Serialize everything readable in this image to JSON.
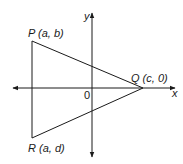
{
  "diagram": {
    "type": "coordinate-geometry",
    "axes": {
      "x_label": "x",
      "y_label": "y",
      "origin_label": "0"
    },
    "points": [
      {
        "name": "P",
        "coords": "(a, b)",
        "label": "P (a, b)"
      },
      {
        "name": "Q",
        "coords": "(c, 0)",
        "label": "Q (c, 0)"
      },
      {
        "name": "R",
        "coords": "(a, d)",
        "label": "R (a, d)"
      }
    ],
    "shape": "triangle PQR",
    "colors": {
      "line": "#1a1a1a",
      "background": "#ffffff"
    }
  }
}
